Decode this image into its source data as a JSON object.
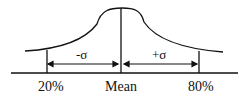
{
  "diagram": {
    "type": "bell-curve",
    "labels": {
      "left": "20%",
      "center": "Mean",
      "right": "80%"
    },
    "intervals": {
      "left": "-σ",
      "right": "+σ"
    },
    "colors": {
      "stroke": "#111111",
      "background": "#ffffff"
    }
  }
}
